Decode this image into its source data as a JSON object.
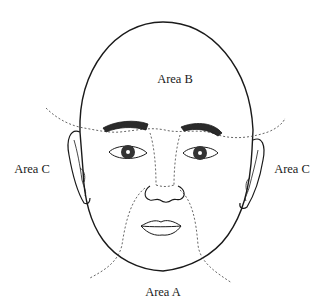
{
  "diagram": {
    "type": "face-zone-illustration",
    "labels": {
      "area_b": "Area B",
      "area_c_left": "Area C",
      "area_c_right": "Area C",
      "area_a": "Area A"
    },
    "colors": {
      "line": "#1a1a1a",
      "dashed": "#555555",
      "background": "#ffffff"
    }
  }
}
